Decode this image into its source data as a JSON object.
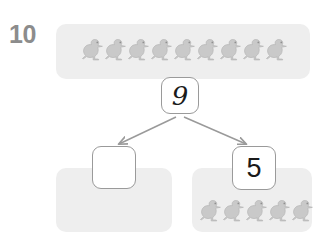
{
  "problem": {
    "type": "number-bond-part-whole",
    "total_label": "10",
    "whole_value": "9",
    "part_left_value": "",
    "part_right_value": "5",
    "counter_icon": "duck-icon",
    "counter_color": "#c9c9c9",
    "panel_color": "#eeeeee",
    "box_border_color": "#9a9a9a",
    "label_color": "#8c8c8c",
    "arrow_color": "#9a9a9a",
    "groups": [
      {
        "name": "whole",
        "counter_count": 9,
        "box_value": "9"
      },
      {
        "name": "part-left",
        "counter_count": 0,
        "box_value": ""
      },
      {
        "name": "part-right",
        "counter_count": 5,
        "box_value": "5"
      }
    ],
    "arrows": [
      {
        "name": "arrow-to-left-part",
        "from": "whole-box",
        "to": "part-left-box"
      },
      {
        "name": "arrow-to-right-part",
        "from": "whole-box",
        "to": "part-right-box"
      }
    ]
  }
}
